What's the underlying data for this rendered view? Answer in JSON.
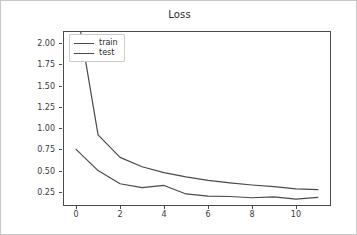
{
  "chart_data": {
    "type": "line",
    "title": "Loss",
    "xlabel": "",
    "ylabel": "",
    "xlim": [
      -0.55,
      11.55
    ],
    "ylim": [
      0.095,
      2.13
    ],
    "grid": false,
    "legend_position": "upper left",
    "xticks": [
      0,
      2,
      4,
      6,
      8,
      10
    ],
    "xtick_labels": [
      "0",
      "2",
      "4",
      "6",
      "8",
      "10"
    ],
    "yticks": [
      0.25,
      0.5,
      0.75,
      1.0,
      1.25,
      1.5,
      1.75,
      2.0
    ],
    "ytick_labels": [
      "0.25",
      "0.50",
      "0.75",
      "1.00",
      "1.25",
      "1.50",
      "1.75",
      "2.00"
    ],
    "x": [
      0,
      1,
      2,
      3,
      4,
      5,
      6,
      7,
      8,
      9,
      10,
      11
    ],
    "series": [
      {
        "name": "train",
        "color": "#4a4a4a",
        "values": [
          2.45,
          0.92,
          0.655,
          0.545,
          0.475,
          0.425,
          0.385,
          0.355,
          0.33,
          0.31,
          0.285,
          0.275
        ]
      },
      {
        "name": "test",
        "color": "#4a4a4a",
        "values": [
          0.75,
          0.5,
          0.345,
          0.3,
          0.325,
          0.225,
          0.2,
          0.195,
          0.18,
          0.19,
          0.165,
          0.185
        ]
      }
    ]
  },
  "legend": {
    "entries": [
      {
        "label": "train"
      },
      {
        "label": "test"
      }
    ]
  }
}
